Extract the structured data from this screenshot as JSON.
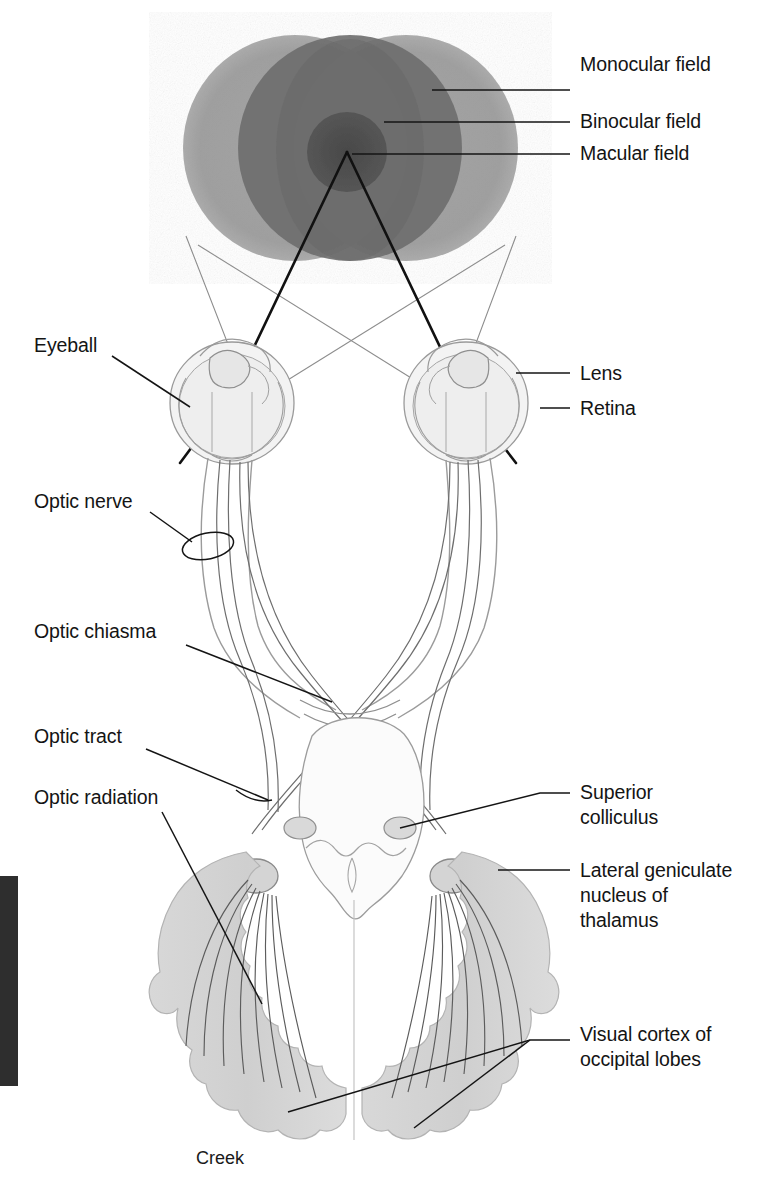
{
  "figure": {
    "signature": "Creek",
    "background_color": "#ffffff",
    "ink_color": "#141414",
    "line_color": "#8a8a8a"
  },
  "visual_fields": {
    "monocular_color": "#9a9a9a",
    "binocular_color": "#6d6d6d",
    "macular_color": "#4a4a4a",
    "left_circle": {
      "cx": 295,
      "cy": 148,
      "rx": 110,
      "ry": 112
    },
    "right_circle": {
      "cx": 405,
      "cy": 148,
      "rx": 110,
      "ry": 112
    },
    "binocular_oval": {
      "cx": 350,
      "cy": 148,
      "rx": 76,
      "ry": 112
    },
    "macular_circle": {
      "cx": 347,
      "cy": 152,
      "r": 39
    }
  },
  "labels": {
    "right": [
      {
        "id": "monocular-field",
        "text": "Monocular field",
        "x": 580,
        "y": 64,
        "leader": {
          "x1": 570,
          "y1": 90,
          "x2": 432,
          "y2": 90
        }
      },
      {
        "id": "binocular-field",
        "text": "Binocular field",
        "x": 580,
        "y": 109,
        "leader": {
          "x1": 570,
          "y1": 122,
          "x2": 384,
          "y2": 122
        }
      },
      {
        "id": "macular-field",
        "text": "Macular field",
        "x": 580,
        "y": 142,
        "leader": {
          "x1": 570,
          "y1": 154,
          "x2": 352,
          "y2": 154
        }
      },
      {
        "id": "lens",
        "text": "Lens",
        "x": 580,
        "y": 361,
        "leader": {
          "x1": 570,
          "y1": 373,
          "x2": 520,
          "y2": 373
        }
      },
      {
        "id": "retina",
        "text": "Retina",
        "x": 580,
        "y": 396,
        "leader": {
          "x1": 570,
          "y1": 408,
          "x2": 543,
          "y2": 408
        }
      },
      {
        "id": "superior-colliculus",
        "text": "Superior\ncolliculus",
        "x": 580,
        "y": 775,
        "leader": {
          "x1": 570,
          "y1": 793,
          "x2": 400,
          "y2": 828
        }
      },
      {
        "id": "lateral-geniculate-nucleus",
        "text": "Lateral geniculate\nnucleus of\nthalamus",
        "x": 580,
        "y": 858,
        "leader": {
          "x1": 570,
          "y1": 870,
          "x2": 498,
          "y2": 870
        }
      },
      {
        "id": "visual-cortex",
        "text": "Visual cortex of\noccipital lobes",
        "x": 580,
        "y": 1025,
        "leader": {
          "x1": 570,
          "y1": 1040,
          "x2": 520,
          "y2": 1040
        }
      }
    ],
    "left": [
      {
        "id": "eyeball",
        "text": "Eyeball",
        "x": 34,
        "y": 335,
        "leader": {
          "x1": 110,
          "y1": 357,
          "x2": 188,
          "y2": 405
        }
      },
      {
        "id": "optic-nerve",
        "text": "Optic nerve",
        "x": 34,
        "y": 492,
        "leader": {
          "x1": 148,
          "y1": 514,
          "x2": 190,
          "y2": 538
        }
      },
      {
        "id": "optic-chiasma",
        "text": "Optic chiasma",
        "x": 34,
        "y": 620,
        "leader": {
          "x1": 185,
          "y1": 644,
          "x2": 330,
          "y2": 700
        }
      },
      {
        "id": "optic-tract",
        "text": "Optic tract",
        "x": 34,
        "y": 725,
        "leader": {
          "x1": 145,
          "y1": 748,
          "x2": 265,
          "y2": 800
        }
      },
      {
        "id": "optic-radiation",
        "text": "Optic radiation",
        "x": 34,
        "y": 786,
        "leader": {
          "x1": 160,
          "y1": 810,
          "x2": 262,
          "y2": 1000
        }
      }
    ]
  },
  "edge_bar": {
    "x": 0,
    "y": 876,
    "width": 18,
    "height": 210,
    "color": "#2e2e2e"
  }
}
